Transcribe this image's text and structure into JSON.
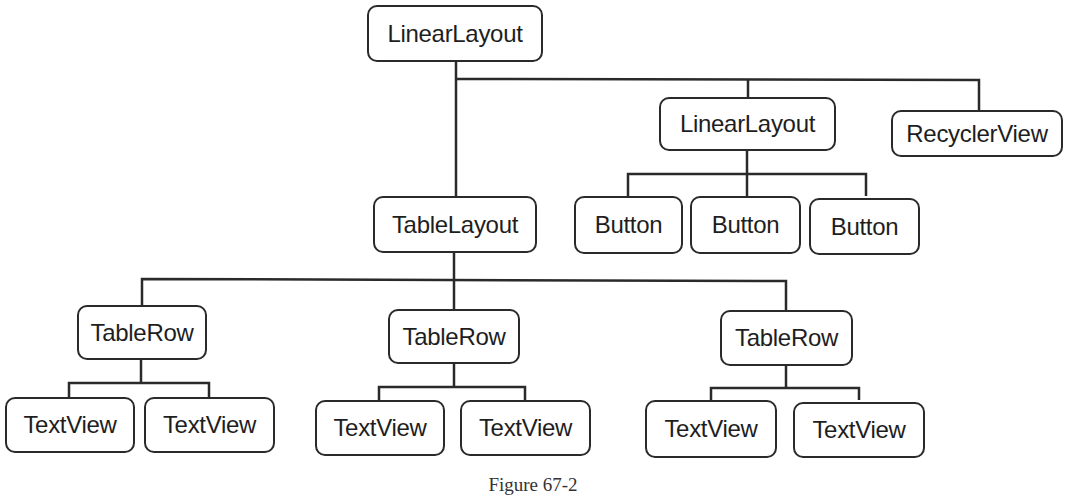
{
  "diagram": {
    "nodes": {
      "root": {
        "label": "LinearLayout"
      },
      "linear2": {
        "label": "LinearLayout"
      },
      "recycler": {
        "label": "RecyclerView"
      },
      "button1": {
        "label": "Button"
      },
      "button2": {
        "label": "Button"
      },
      "button3": {
        "label": "Button"
      },
      "table": {
        "label": "TableLayout"
      },
      "row1": {
        "label": "TableRow"
      },
      "row2": {
        "label": "TableRow"
      },
      "row3": {
        "label": "TableRow"
      },
      "tv1": {
        "label": "TextView"
      },
      "tv2": {
        "label": "TextView"
      },
      "tv3": {
        "label": "TextView"
      },
      "tv4": {
        "label": "TextView"
      },
      "tv5": {
        "label": "TextView"
      },
      "tv6": {
        "label": "TextView"
      }
    },
    "edges": [
      [
        "root",
        "table"
      ],
      [
        "root",
        "linear2"
      ],
      [
        "root",
        "recycler"
      ],
      [
        "linear2",
        "button1"
      ],
      [
        "linear2",
        "button2"
      ],
      [
        "linear2",
        "button3"
      ],
      [
        "table",
        "row1"
      ],
      [
        "table",
        "row2"
      ],
      [
        "table",
        "row3"
      ],
      [
        "row1",
        "tv1"
      ],
      [
        "row1",
        "tv2"
      ],
      [
        "row2",
        "tv3"
      ],
      [
        "row2",
        "tv4"
      ],
      [
        "row3",
        "tv5"
      ],
      [
        "row3",
        "tv6"
      ]
    ],
    "line_color": "#2a2a2a"
  },
  "caption": "Figure 67-2"
}
